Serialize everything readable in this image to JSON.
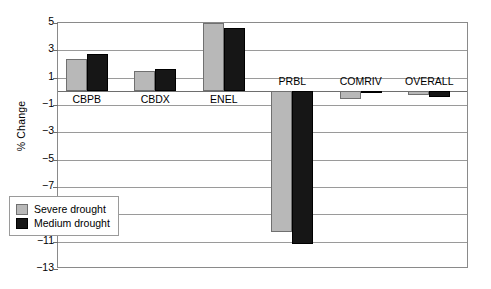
{
  "chart_data": {
    "type": "bar",
    "title": "",
    "xlabel": "",
    "ylabel": "% Change",
    "ylim": [
      -13,
      5
    ],
    "yticks": [
      5,
      3,
      1,
      -1,
      -3,
      -5,
      -7,
      -9,
      -11,
      -13
    ],
    "ytick_labels": [
      "5",
      "3",
      "1",
      "−1",
      "−3",
      "−5",
      "−7",
      "−9",
      "−11",
      "−13"
    ],
    "grid": true,
    "legend_position": "lower-left",
    "categories": [
      "CBPB",
      "CBDX",
      "ENEL",
      "PRBL",
      "COMRIV",
      "OVERALL"
    ],
    "series": [
      {
        "name": "Severe drought",
        "color": "#b8b8b8",
        "values": [
          2.4,
          1.5,
          5.0,
          -10.3,
          -0.55,
          -0.3
        ]
      },
      {
        "name": "Medium drought",
        "color": "#161616",
        "values": [
          2.7,
          1.65,
          4.6,
          -11.2,
          -0.15,
          -0.4
        ]
      }
    ]
  },
  "legend": {
    "items": [
      {
        "label": "Severe drought",
        "swatch": "severe"
      },
      {
        "label": "Medium drought",
        "swatch": "medium"
      }
    ]
  }
}
